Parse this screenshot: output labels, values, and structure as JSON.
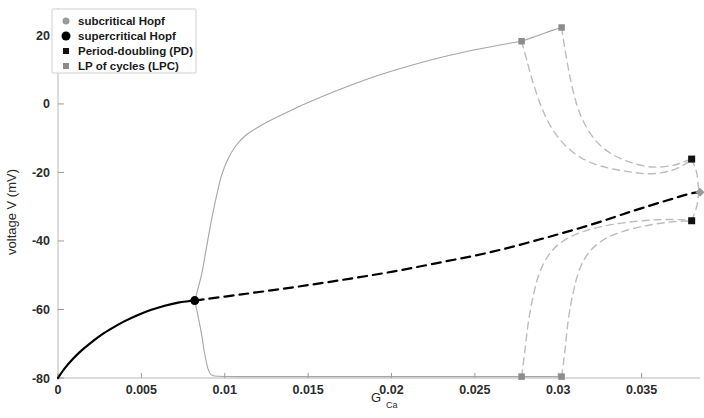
{
  "chart_data": {
    "type": "line",
    "title": "",
    "xlabel": "G_Ca",
    "xlabel_base": "G",
    "xlabel_sub": "Ca",
    "ylabel": "voltage V (mV)",
    "xlim": [
      0,
      0.0385
    ],
    "ylim": [
      -80,
      28
    ],
    "xticks": [
      0,
      0.005,
      0.01,
      0.015,
      0.02,
      0.025,
      0.03,
      0.035
    ],
    "xtick_labels": [
      "0",
      "0.005",
      "0.01",
      "0.015",
      "0.02",
      "0.025",
      "0.03",
      "0.035"
    ],
    "yticks": [
      20,
      0,
      -20,
      -40,
      -60,
      -80
    ],
    "ytick_labels": [
      "20",
      "0",
      "-20",
      "-40",
      "-60",
      "-80"
    ],
    "grid": false,
    "legend_position": "top-left",
    "colors": {
      "stable_equilibrium": "#000000",
      "unstable_equilibrium": "#000000",
      "limit_cycle_stable": "#9e9e9e",
      "limit_cycle_unstable": "#bdbdbd",
      "subcritical_hopf": "#9a9a9a",
      "supercritical_hopf": "#000000",
      "period_doubling": "#111111",
      "lp_of_cycles": "#8c8c8c"
    },
    "legend": [
      {
        "label": "subcritical Hopf",
        "marker": "circle",
        "color": "#9a9a9a",
        "size": 7
      },
      {
        "label": "supercritical Hopf",
        "marker": "circle",
        "color": "#000000",
        "size": 9
      },
      {
        "label": "Period-doubling (PD)",
        "marker": "square",
        "color": "#111111",
        "size": 6
      },
      {
        "label": "LP of cycles (LPC)",
        "marker": "square",
        "color": "#8c8c8c",
        "size": 6
      }
    ],
    "series": [
      {
        "name": "stable equilibrium (solid black)",
        "style": "solid",
        "color": "#000000",
        "width": 2.2,
        "points": [
          [
            0.0,
            -80.0
          ],
          [
            0.0004,
            -77.2
          ],
          [
            0.0009,
            -74.4
          ],
          [
            0.0014,
            -72.0
          ],
          [
            0.002,
            -69.6
          ],
          [
            0.0026,
            -67.4
          ],
          [
            0.0033,
            -65.3
          ],
          [
            0.004,
            -63.4
          ],
          [
            0.0048,
            -61.6
          ],
          [
            0.0056,
            -60.1
          ],
          [
            0.0064,
            -58.9
          ],
          [
            0.0072,
            -58.0
          ],
          [
            0.0078,
            -57.6
          ],
          [
            0.0082,
            -57.4
          ]
        ]
      },
      {
        "name": "unstable equilibrium (dashed black)",
        "style": "dashed",
        "color": "#000000",
        "width": 2.2,
        "dash": "9,6",
        "points": [
          [
            0.0082,
            -57.4
          ],
          [
            0.011,
            -55.6
          ],
          [
            0.014,
            -53.6
          ],
          [
            0.017,
            -51.4
          ],
          [
            0.02,
            -49.0
          ],
          [
            0.023,
            -46.2
          ],
          [
            0.026,
            -43.2
          ],
          [
            0.029,
            -39.4
          ],
          [
            0.032,
            -35.2
          ],
          [
            0.0345,
            -31.2
          ],
          [
            0.0365,
            -28.2
          ],
          [
            0.0379,
            -26.2
          ],
          [
            0.0385,
            -25.8
          ]
        ]
      },
      {
        "name": "stable limit cycle upper envelope",
        "style": "solid",
        "color": "#a5a5a5",
        "width": 1.1,
        "points": [
          [
            0.0082,
            -57.4
          ],
          [
            0.0086,
            -50.0
          ],
          [
            0.0089,
            -42.0
          ],
          [
            0.0092,
            -34.0
          ],
          [
            0.0095,
            -27.0
          ],
          [
            0.0098,
            -21.0
          ],
          [
            0.0102,
            -16.0
          ],
          [
            0.0107,
            -12.0
          ],
          [
            0.0113,
            -9.0
          ],
          [
            0.0122,
            -6.2
          ],
          [
            0.0135,
            -3.0
          ],
          [
            0.015,
            0.4
          ],
          [
            0.017,
            4.4
          ],
          [
            0.019,
            8.0
          ],
          [
            0.021,
            11.0
          ],
          [
            0.023,
            13.6
          ],
          [
            0.025,
            15.8
          ],
          [
            0.0265,
            17.2
          ],
          [
            0.0278,
            18.3
          ]
        ]
      },
      {
        "name": "stable limit cycle lower envelope",
        "style": "solid",
        "color": "#a5a5a5",
        "width": 1.1,
        "points": [
          [
            0.0082,
            -57.4
          ],
          [
            0.0084,
            -62.0
          ],
          [
            0.0086,
            -67.0
          ],
          [
            0.0088,
            -73.0
          ],
          [
            0.009,
            -77.4
          ],
          [
            0.0092,
            -79.1
          ],
          [
            0.0096,
            -79.5
          ],
          [
            0.011,
            -79.6
          ],
          [
            0.015,
            -79.6
          ],
          [
            0.02,
            -79.6
          ],
          [
            0.025,
            -79.6
          ],
          [
            0.0278,
            -79.6
          ]
        ]
      },
      {
        "name": "LPC connector upper (stable to LPC2)",
        "style": "solid",
        "color": "#a5a5a5",
        "width": 1.1,
        "points": [
          [
            0.0278,
            18.3
          ],
          [
            0.0288,
            20.0
          ],
          [
            0.0296,
            21.4
          ],
          [
            0.0302,
            22.3
          ]
        ]
      },
      {
        "name": "LPC connector lower (stable to LPC2)",
        "style": "solid",
        "color": "#a5a5a5",
        "width": 1.1,
        "points": [
          [
            0.0278,
            -79.6
          ],
          [
            0.029,
            -79.6
          ],
          [
            0.0302,
            -79.6
          ]
        ]
      },
      {
        "name": "unstable cycle upper branch from LPC1",
        "style": "dashed",
        "color": "#bdbdbd",
        "width": 1.4,
        "dash": "7,5",
        "points": [
          [
            0.0278,
            18.3
          ],
          [
            0.0281,
            13.0
          ],
          [
            0.0285,
            6.0
          ],
          [
            0.029,
            -1.0
          ],
          [
            0.0296,
            -7.0
          ],
          [
            0.0304,
            -12.0
          ],
          [
            0.0314,
            -15.8
          ],
          [
            0.0326,
            -18.2
          ],
          [
            0.034,
            -19.6
          ],
          [
            0.0355,
            -20.4
          ],
          [
            0.0368,
            -19.4
          ],
          [
            0.0376,
            -17.6
          ],
          [
            0.038,
            -16.2
          ]
        ]
      },
      {
        "name": "unstable cycle upper branch from LPC2",
        "style": "dashed",
        "color": "#bdbdbd",
        "width": 1.4,
        "dash": "7,5",
        "points": [
          [
            0.0302,
            22.3
          ],
          [
            0.0304,
            16.0
          ],
          [
            0.0307,
            8.0
          ],
          [
            0.0311,
            0.0
          ],
          [
            0.0316,
            -6.0
          ],
          [
            0.0323,
            -11.0
          ],
          [
            0.0332,
            -14.6
          ],
          [
            0.0343,
            -17.0
          ],
          [
            0.0356,
            -18.4
          ],
          [
            0.0368,
            -18.0
          ],
          [
            0.0376,
            -16.8
          ],
          [
            0.038,
            -16.0
          ]
        ]
      },
      {
        "name": "unstable cycle lower branch from LPC1",
        "style": "dashed",
        "color": "#bdbdbd",
        "width": 1.4,
        "dash": "7,5",
        "points": [
          [
            0.0278,
            -79.6
          ],
          [
            0.028,
            -72.0
          ],
          [
            0.0282,
            -64.0
          ],
          [
            0.0285,
            -56.0
          ],
          [
            0.0289,
            -49.0
          ],
          [
            0.0295,
            -43.6
          ],
          [
            0.0303,
            -40.0
          ],
          [
            0.0314,
            -37.4
          ],
          [
            0.0328,
            -35.6
          ],
          [
            0.0344,
            -34.4
          ],
          [
            0.036,
            -33.8
          ],
          [
            0.0374,
            -33.8
          ],
          [
            0.038,
            -34.0
          ]
        ]
      },
      {
        "name": "unstable cycle lower branch from LPC2",
        "style": "dashed",
        "color": "#bdbdbd",
        "width": 1.4,
        "dash": "7,5",
        "points": [
          [
            0.0302,
            -79.6
          ],
          [
            0.0304,
            -72.0
          ],
          [
            0.0306,
            -63.0
          ],
          [
            0.0309,
            -55.0
          ],
          [
            0.0313,
            -48.0
          ],
          [
            0.0319,
            -43.0
          ],
          [
            0.0328,
            -39.4
          ],
          [
            0.0339,
            -37.2
          ],
          [
            0.0352,
            -35.6
          ],
          [
            0.0365,
            -34.6
          ],
          [
            0.0375,
            -34.2
          ],
          [
            0.038,
            -34.2
          ]
        ]
      },
      {
        "name": "cycle branch to Hopf right",
        "style": "dashed",
        "color": "#bdbdbd",
        "width": 1.4,
        "dash": "7,5",
        "points": [
          [
            0.038,
            -16.1
          ],
          [
            0.0383,
            -20.0
          ],
          [
            0.0384,
            -24.0
          ],
          [
            0.0385,
            -25.8
          ]
        ]
      },
      {
        "name": "cycle branch to Hopf right lower",
        "style": "dashed",
        "color": "#bdbdbd",
        "width": 1.4,
        "dash": "7,5",
        "points": [
          [
            0.038,
            -34.1
          ],
          [
            0.0383,
            -30.0
          ],
          [
            0.0384,
            -27.0
          ],
          [
            0.0385,
            -25.8
          ]
        ]
      }
    ],
    "markers": [
      {
        "name": "supercritical Hopf",
        "type": "supercritical_hopf",
        "marker": "circle",
        "x": 0.0082,
        "y": -57.4,
        "size": 9,
        "color": "#000000"
      },
      {
        "name": "subcritical Hopf",
        "type": "subcritical_hopf",
        "marker": "diamond",
        "x": 0.0385,
        "y": -25.8,
        "size": 9,
        "color": "#9a9a9a"
      },
      {
        "name": "Period-doubling upper",
        "type": "period_doubling",
        "marker": "square",
        "x": 0.038,
        "y": -16.1,
        "size": 7,
        "color": "#111111"
      },
      {
        "name": "Period-doubling lower",
        "type": "period_doubling",
        "marker": "square",
        "x": 0.038,
        "y": -34.1,
        "size": 7,
        "color": "#111111"
      },
      {
        "name": "LPC upper 1",
        "type": "lp_of_cycles",
        "marker": "square",
        "x": 0.0278,
        "y": 18.3,
        "size": 6.5,
        "color": "#8c8c8c"
      },
      {
        "name": "LPC upper 2",
        "type": "lp_of_cycles",
        "marker": "square",
        "x": 0.0302,
        "y": 22.3,
        "size": 6.5,
        "color": "#8c8c8c"
      },
      {
        "name": "LPC lower 1",
        "type": "lp_of_cycles",
        "marker": "square",
        "x": 0.0278,
        "y": -79.6,
        "size": 6.5,
        "color": "#8c8c8c"
      },
      {
        "name": "LPC lower 2",
        "type": "lp_of_cycles",
        "marker": "square",
        "x": 0.0302,
        "y": -79.6,
        "size": 6.5,
        "color": "#8c8c8c"
      }
    ]
  }
}
